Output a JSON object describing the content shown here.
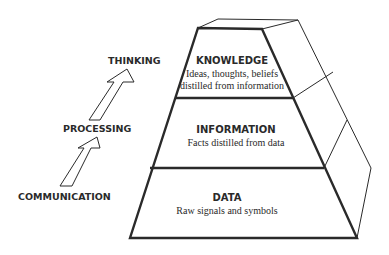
{
  "diagram": {
    "type": "pyramid",
    "levels": [
      {
        "title": "KNOWLEDGE",
        "lines": [
          "Ideas, thoughts, beliefs",
          "distilled from information"
        ]
      },
      {
        "title": "INFORMATION",
        "lines": [
          "Facts distilled from data"
        ]
      },
      {
        "title": "DATA",
        "lines": [
          "Raw signals and symbols"
        ]
      }
    ],
    "process_labels": {
      "top": "THINKING",
      "middle": "PROCESSING",
      "bottom": "COMMUNICATION"
    },
    "colors": {
      "stroke": "#2a2a2a",
      "background": "#ffffff",
      "text": "#2a2a2a"
    }
  }
}
